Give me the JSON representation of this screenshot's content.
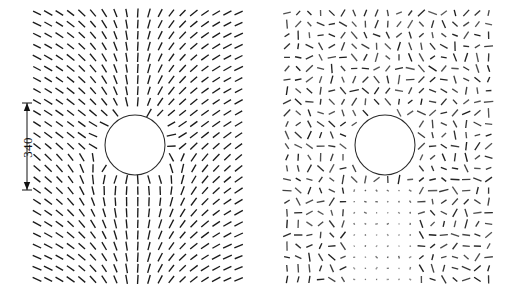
{
  "figure": {
    "width": 511,
    "height": 303,
    "background": "#ffffff",
    "stroke_color": "#1a1a1a",
    "obstacle_color": "#2a2a2a"
  },
  "annotation": {
    "dimension_label": "340",
    "dimension_units": "",
    "line_x": 27,
    "line_top_y": 103,
    "line_bottom_y": 190,
    "label_x": 27,
    "label_y": 147
  },
  "chart_data": {
    "type": "scatter",
    "subtype": "vector-orientation-field",
    "title": "",
    "xlabel": "",
    "ylabel": "",
    "grid": false,
    "legend": null,
    "panels": [
      {
        "name": "left-panel",
        "label": "",
        "x0": 37,
        "y0": 13,
        "cols": 19,
        "rows": 25,
        "dx": 11.2,
        "dy": 11.1,
        "seg_len": 9.0,
        "obstacle": {
          "cx": 135,
          "cy": 145,
          "r": 30
        },
        "model": "smooth",
        "noise": 0.0,
        "seed": 17
      },
      {
        "name": "right-panel",
        "label": "",
        "x0": 287,
        "y0": 13,
        "cols": 19,
        "rows": 25,
        "dx": 11.2,
        "dy": 11.1,
        "seg_len": 9.0,
        "obstacle": {
          "cx": 385,
          "cy": 145,
          "r": 30
        },
        "model": "noisy",
        "noise": 0.92,
        "seed": 91
      }
    ],
    "axis_ranges": {
      "xlim": [
        0,
        511
      ],
      "ylim": [
        0,
        303
      ]
    }
  }
}
